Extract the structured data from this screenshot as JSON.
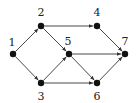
{
  "graph": {
    "type": "directed",
    "nodes": [
      {
        "id": "1",
        "label": "1",
        "x": 13,
        "y": 54,
        "lx": 12,
        "ly": 46
      },
      {
        "id": "2",
        "label": "2",
        "x": 41,
        "y": 26,
        "lx": 41,
        "ly": 16
      },
      {
        "id": "3",
        "label": "3",
        "x": 41,
        "y": 83,
        "lx": 41,
        "ly": 100
      },
      {
        "id": "4",
        "label": "4",
        "x": 97,
        "y": 26,
        "lx": 97,
        "ly": 16
      },
      {
        "id": "5",
        "label": "5",
        "x": 69,
        "y": 54,
        "lx": 68,
        "ly": 45
      },
      {
        "id": "6",
        "label": "6",
        "x": 97,
        "y": 83,
        "lx": 97,
        "ly": 100
      },
      {
        "id": "7",
        "label": "7",
        "x": 125,
        "y": 54,
        "lx": 125,
        "ly": 45
      }
    ],
    "edges": [
      {
        "from": "1",
        "to": "2"
      },
      {
        "from": "1",
        "to": "3"
      },
      {
        "from": "2",
        "to": "4"
      },
      {
        "from": "2",
        "to": "5"
      },
      {
        "from": "3",
        "to": "5"
      },
      {
        "from": "3",
        "to": "6"
      },
      {
        "from": "5",
        "to": "7"
      },
      {
        "from": "5",
        "to": "6"
      },
      {
        "from": "4",
        "to": "7"
      },
      {
        "from": "6",
        "to": "7"
      }
    ]
  }
}
